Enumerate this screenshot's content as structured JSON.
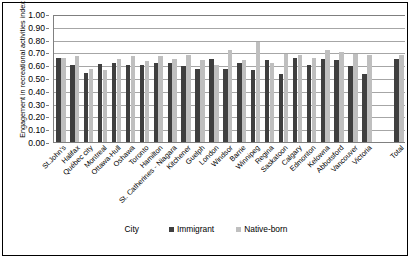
{
  "chart_data": {
    "type": "bar",
    "title": "",
    "xlabel": "City",
    "ylabel": "Engagement in recreational activities index",
    "ylim": [
      0.0,
      1.0
    ],
    "ytick_labels": [
      "1.00",
      "0.90",
      "0.80",
      "0.70",
      "0.60",
      "0.50",
      "0.40",
      "0.30",
      "0.20",
      "0.10",
      "0.00"
    ],
    "ytick_values": [
      1.0,
      0.9,
      0.8,
      0.7,
      0.6,
      0.5,
      0.4,
      0.3,
      0.2,
      0.1,
      0.0
    ],
    "grid": true,
    "legend_position": "bottom",
    "categories": [
      "St.John's",
      "Halifax",
      "Québec city",
      "Montreal",
      "Ottawa-Hull",
      "Oshawa",
      "Toronto",
      "Hamilton",
      "St. Catherines - Niagara",
      "Kitchener",
      "Guelph",
      "London",
      "Windsor",
      "Barrie",
      "Winnipeg",
      "Regina",
      "Saskatoon",
      "Calgary",
      "Edmonton",
      "Kelowna",
      "Abbotsford",
      "Vancouver",
      "Victoria",
      "Total"
    ],
    "series": [
      {
        "name": "Immigrant",
        "color": "#3f3f3f",
        "values": [
          0.66,
          0.6,
          0.54,
          0.61,
          0.62,
          0.6,
          0.6,
          0.62,
          0.62,
          0.59,
          0.57,
          0.65,
          0.57,
          0.62,
          0.56,
          0.64,
          0.53,
          0.66,
          0.6,
          0.65,
          0.64,
          0.59,
          0.53,
          0.65
        ]
      },
      {
        "name": "Native-born",
        "color": "#bfbfbf",
        "values": [
          0.66,
          0.67,
          0.57,
          0.56,
          0.65,
          0.67,
          0.63,
          0.67,
          0.65,
          0.68,
          0.64,
          0.6,
          0.72,
          0.64,
          0.78,
          0.62,
          0.69,
          0.68,
          0.66,
          0.72,
          0.7,
          0.69,
          0.68,
          0.68
        ]
      }
    ]
  },
  "legend": {
    "axis_label": "City",
    "entries": [
      {
        "label": "Immigrant",
        "color": "#3f3f3f"
      },
      {
        "label": "Native-born",
        "color": "#bfbfbf"
      }
    ]
  }
}
